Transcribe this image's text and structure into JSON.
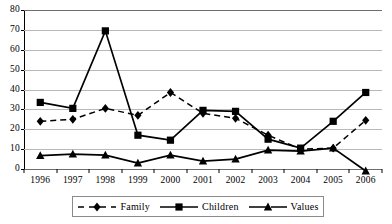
{
  "chart_data": {
    "type": "line",
    "title": "",
    "xlabel": "",
    "ylabel": "",
    "categories": [
      "1996",
      "1997",
      "1998",
      "1999",
      "2000",
      "2001",
      "2002",
      "2003",
      "2004",
      "2005",
      "2006"
    ],
    "ylim": [
      0,
      80
    ],
    "yticks": [
      0,
      10,
      20,
      30,
      40,
      50,
      60,
      70,
      80
    ],
    "grid": true,
    "legend_position": "bottom",
    "series": [
      {
        "name": "Family",
        "marker": "diamond",
        "line": "dashed",
        "color": "#000000",
        "values": [
          24,
          25,
          30.5,
          27,
          38.5,
          28,
          25.5,
          17,
          10,
          10.5,
          24.5
        ]
      },
      {
        "name": "Children",
        "marker": "square",
        "line": "solid",
        "color": "#000000",
        "values": [
          33.5,
          30.5,
          69.5,
          17,
          14.5,
          29.5,
          29,
          15,
          10.5,
          24,
          38.5
        ]
      },
      {
        "name": "Values",
        "marker": "triangle",
        "line": "solid",
        "color": "#000000",
        "values": [
          6.7,
          7.5,
          7,
          3,
          7,
          4,
          5,
          9.5,
          9,
          10.5,
          -1
        ]
      }
    ]
  },
  "axis": {
    "ytick_labels": [
      "0",
      "10",
      "20",
      "30",
      "40",
      "50",
      "60",
      "70",
      "80"
    ],
    "xtick_labels": [
      "1996",
      "1997",
      "1998",
      "1999",
      "2000",
      "2001",
      "2002",
      "2003",
      "2004",
      "2005",
      "2006"
    ]
  },
  "legend": {
    "items": [
      {
        "label": "Family",
        "marker": "diamond-marker-icon",
        "line": "dashed"
      },
      {
        "label": "Children",
        "marker": "square-marker-icon",
        "line": "solid"
      },
      {
        "label": "Values",
        "marker": "triangle-marker-icon",
        "line": "solid-dash"
      }
    ]
  }
}
